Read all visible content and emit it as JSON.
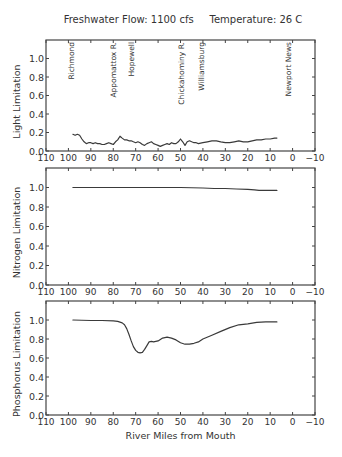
{
  "header": {
    "title": "Freshwater Flow: 1100 cfs     Temperature: 26 C"
  },
  "style": {
    "line_color": "#3a3a3a",
    "axis_color": "#444444",
    "text_color": "#333333",
    "background": "#ffffff"
  },
  "chart_data": [
    {
      "type": "line",
      "title": "Freshwater Flow: 1100 cfs     Temperature: 26 C",
      "xlabel": "",
      "ylabel": "Light Limitation",
      "xlim": [
        110,
        -10
      ],
      "ylim": [
        0,
        1.2
      ],
      "xticks": [
        110,
        100,
        90,
        80,
        70,
        60,
        50,
        40,
        30,
        20,
        10,
        0,
        -10
      ],
      "xtick_labels": [
        "110",
        "100",
        "90",
        "80",
        "70",
        "60",
        "50",
        "40",
        "30",
        "20",
        "10",
        "0",
        "−10"
      ],
      "yticks": [
        0.0,
        0.2,
        0.4,
        0.6,
        0.8,
        1.0
      ],
      "ytick_labels": [
        "0.0",
        "0.2",
        "0.4",
        "0.6",
        "0.8",
        "1.0"
      ],
      "grid": false,
      "annotations": [
        {
          "text": "Richmond",
          "x": 99
        },
        {
          "text": "Appomattox R.",
          "x": 80
        },
        {
          "text": "Hopewell",
          "x": 72
        },
        {
          "text": "Chickahominy R.",
          "x": 50
        },
        {
          "text": "Williamsburg",
          "x": 41
        },
        {
          "text": "Newport News",
          "x": 2
        }
      ],
      "series": [
        {
          "name": "Light Limitation",
          "x": [
            98,
            97,
            96,
            95,
            94,
            93,
            92,
            91,
            90,
            89,
            88,
            87,
            86,
            85,
            84,
            83,
            82,
            81,
            80,
            79,
            78,
            77,
            76,
            75,
            74,
            73,
            72,
            71,
            70,
            69,
            68,
            67,
            66,
            65,
            64,
            63,
            62,
            61,
            60,
            59,
            58,
            57,
            56,
            55,
            54,
            53,
            52,
            51,
            50,
            49,
            48,
            47,
            46,
            45,
            44,
            43,
            42,
            40,
            38,
            36,
            34,
            32,
            30,
            28,
            26,
            24,
            22,
            20,
            18,
            16,
            14,
            12,
            10,
            8,
            7
          ],
          "y": [
            0.18,
            0.17,
            0.18,
            0.17,
            0.13,
            0.1,
            0.08,
            0.09,
            0.09,
            0.08,
            0.09,
            0.08,
            0.08,
            0.07,
            0.07,
            0.08,
            0.09,
            0.08,
            0.07,
            0.1,
            0.12,
            0.16,
            0.14,
            0.12,
            0.12,
            0.11,
            0.11,
            0.1,
            0.09,
            0.1,
            0.09,
            0.07,
            0.06,
            0.08,
            0.09,
            0.1,
            0.08,
            0.07,
            0.06,
            0.05,
            0.06,
            0.07,
            0.08,
            0.07,
            0.09,
            0.08,
            0.08,
            0.1,
            0.13,
            0.1,
            0.06,
            0.1,
            0.11,
            0.1,
            0.09,
            0.09,
            0.08,
            0.09,
            0.1,
            0.11,
            0.11,
            0.1,
            0.09,
            0.09,
            0.1,
            0.11,
            0.1,
            0.1,
            0.11,
            0.12,
            0.12,
            0.13,
            0.13,
            0.14,
            0.14
          ]
        }
      ]
    },
    {
      "type": "line",
      "title": "",
      "xlabel": "",
      "ylabel": "Nitrogen Limitation",
      "xlim": [
        110,
        -10
      ],
      "ylim": [
        0,
        1.2
      ],
      "xticks": [
        110,
        100,
        90,
        80,
        70,
        60,
        50,
        40,
        30,
        20,
        10,
        0,
        -10
      ],
      "xtick_labels": [
        "110",
        "100",
        "90",
        "80",
        "70",
        "60",
        "50",
        "40",
        "30",
        "20",
        "10",
        "0",
        "−10"
      ],
      "yticks": [
        0.0,
        0.2,
        0.4,
        0.6,
        0.8,
        1.0
      ],
      "ytick_labels": [
        "0.0",
        "0.2",
        "0.4",
        "0.6",
        "0.8",
        "1.0"
      ],
      "grid": false,
      "series": [
        {
          "name": "Nitrogen Limitation",
          "x": [
            98,
            90,
            80,
            70,
            60,
            50,
            40,
            35,
            30,
            25,
            20,
            17,
            15,
            12,
            10,
            7
          ],
          "y": [
            1.0,
            1.0,
            1.0,
            1.0,
            1.0,
            1.0,
            0.995,
            0.99,
            0.99,
            0.985,
            0.98,
            0.975,
            0.97,
            0.97,
            0.97,
            0.97
          ]
        }
      ]
    },
    {
      "type": "line",
      "title": "",
      "xlabel": "River Miles from Mouth",
      "ylabel": "Phosphorus Limitation",
      "xlim": [
        110,
        -10
      ],
      "ylim": [
        0,
        1.2
      ],
      "xticks": [
        110,
        100,
        90,
        80,
        70,
        60,
        50,
        40,
        30,
        20,
        10,
        0,
        -10
      ],
      "xtick_labels": [
        "110",
        "100",
        "90",
        "80",
        "70",
        "60",
        "50",
        "40",
        "30",
        "20",
        "10",
        "0",
        "−10"
      ],
      "yticks": [
        0.0,
        0.2,
        0.4,
        0.6,
        0.8,
        1.0
      ],
      "ytick_labels": [
        "0.0",
        "0.2",
        "0.4",
        "0.6",
        "0.8",
        "1.0"
      ],
      "grid": false,
      "series": [
        {
          "name": "Phosphorus Limitation",
          "x": [
            98,
            90,
            85,
            80,
            78,
            76,
            75,
            74,
            73,
            72,
            71,
            70,
            69,
            68,
            67,
            66,
            65,
            64,
            63,
            62,
            61,
            60,
            58,
            56,
            54,
            52,
            50,
            48,
            46,
            44,
            42,
            40,
            36,
            32,
            28,
            24,
            20,
            16,
            12,
            10,
            7
          ],
          "y": [
            1.0,
            0.995,
            0.995,
            0.99,
            0.985,
            0.97,
            0.95,
            0.91,
            0.85,
            0.78,
            0.72,
            0.68,
            0.66,
            0.655,
            0.66,
            0.69,
            0.73,
            0.77,
            0.775,
            0.77,
            0.775,
            0.78,
            0.81,
            0.82,
            0.81,
            0.79,
            0.76,
            0.745,
            0.745,
            0.755,
            0.77,
            0.8,
            0.84,
            0.88,
            0.92,
            0.95,
            0.96,
            0.975,
            0.98,
            0.98,
            0.98
          ]
        }
      ]
    }
  ]
}
